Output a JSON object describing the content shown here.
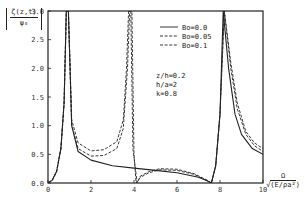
{
  "chart_data": {
    "type": "line",
    "title": "",
    "xlabel": "Ω / √(E/ρa²)",
    "ylabel": "|ζ(z,t) / ψ₀|",
    "xlim": [
      0,
      10
    ],
    "ylim": [
      0,
      3.0
    ],
    "x_ticks": [
      "0",
      "2",
      "4",
      "6",
      "8",
      "10"
    ],
    "y_ticks": [
      "0.0",
      "0.5",
      "1.0",
      "1.5",
      "2.0",
      "2.5",
      "3.0"
    ],
    "grid": false,
    "legend_position": "upper-right",
    "annotations": [
      "z/h=0.2",
      "h/a=2",
      "k=0.8"
    ],
    "series": [
      {
        "name": "Bo=0.0",
        "style": "solid",
        "x": [
          0.0,
          0.2,
          0.4,
          0.6,
          0.75,
          0.85,
          0.95,
          1.1,
          1.4,
          2.0,
          3.0,
          4.0,
          5.0,
          6.0,
          7.0,
          7.4,
          7.6,
          7.8,
          8.0,
          8.15,
          8.4,
          8.7,
          9.0,
          9.5,
          10.0
        ],
        "y": [
          0.0,
          0.05,
          0.2,
          0.6,
          1.4,
          3.0,
          3.0,
          1.0,
          0.55,
          0.4,
          0.3,
          0.26,
          0.22,
          0.18,
          0.1,
          0.04,
          0.0,
          0.3,
          1.2,
          3.0,
          2.0,
          1.2,
          0.85,
          0.6,
          0.5
        ]
      },
      {
        "name": "Bo=0.05",
        "style": "dashed",
        "x": [
          0.0,
          0.2,
          0.4,
          0.6,
          0.75,
          0.85,
          0.95,
          1.1,
          1.4,
          2.0,
          2.6,
          3.2,
          3.5,
          3.7,
          3.8,
          3.9,
          4.0,
          4.1,
          4.3,
          4.7,
          5.2,
          6.0,
          6.8,
          7.4,
          7.6,
          7.8,
          8.0,
          8.2,
          8.5,
          8.8,
          9.2,
          9.6,
          10.0
        ],
        "y": [
          0.0,
          0.05,
          0.2,
          0.6,
          1.4,
          3.0,
          3.0,
          1.0,
          0.6,
          0.47,
          0.48,
          0.6,
          0.95,
          2.0,
          3.0,
          3.0,
          0.5,
          0.0,
          0.1,
          0.18,
          0.23,
          0.22,
          0.15,
          0.04,
          0.0,
          0.3,
          1.2,
          3.0,
          2.0,
          1.3,
          0.85,
          0.65,
          0.55
        ]
      },
      {
        "name": "Bo=0.1",
        "style": "dashed",
        "x": [
          0.0,
          0.2,
          0.4,
          0.6,
          0.75,
          0.85,
          0.95,
          1.1,
          1.4,
          2.0,
          2.6,
          3.2,
          3.5,
          3.65,
          3.75,
          3.85,
          3.95,
          4.15,
          4.3,
          4.7,
          5.2,
          6.0,
          6.8,
          7.4,
          7.6,
          7.8,
          8.0,
          8.2,
          8.5,
          8.8,
          9.2,
          9.6,
          10.0
        ],
        "y": [
          0.0,
          0.05,
          0.2,
          0.6,
          1.4,
          3.0,
          3.0,
          1.1,
          0.7,
          0.56,
          0.58,
          0.72,
          1.1,
          2.0,
          3.0,
          3.0,
          0.6,
          0.0,
          0.12,
          0.2,
          0.25,
          0.24,
          0.16,
          0.05,
          0.0,
          0.3,
          1.2,
          3.0,
          2.1,
          1.4,
          0.9,
          0.7,
          0.6
        ]
      }
    ]
  },
  "labels": {
    "ylabel_num": "ζ(z,t)",
    "ylabel_den": "ψ₀",
    "xlabel_num": "Ω",
    "xlabel_den": "√(E/ρa²)"
  }
}
